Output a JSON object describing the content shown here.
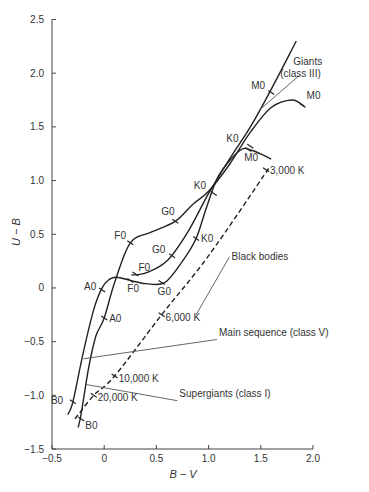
{
  "chart_data": {
    "type": "line",
    "title": "",
    "xlabel": "B − V",
    "ylabel": "U − B",
    "xlim": [
      -0.5,
      2.0
    ],
    "ylim": [
      -1.5,
      2.5
    ],
    "xticks": [
      "−0.5",
      "0",
      "0.5",
      "1.0",
      "1.5",
      "2.0"
    ],
    "xtick_values": [
      -0.5,
      0,
      0.5,
      1.0,
      1.5,
      2.0
    ],
    "yticks": [
      "2.5",
      "2.0",
      "1.5",
      "1.0",
      "0.5",
      "0",
      "−0.5",
      "−1.0",
      "−1.5"
    ],
    "ytick_values": [
      2.5,
      2.0,
      1.5,
      1.0,
      0.5,
      0,
      -0.5,
      -1.0,
      -1.5
    ],
    "grid": false,
    "series": [
      {
        "name": "Supergiants (class I)",
        "style": "solid",
        "x": [
          -0.25,
          -0.22,
          -0.15,
          -0.08,
          0.0,
          0.1,
          0.25,
          0.45,
          0.68,
          0.85,
          1.0,
          1.2,
          1.4,
          1.6,
          1.8,
          1.92
        ],
        "y": [
          -1.3,
          -1.17,
          -0.75,
          -0.45,
          -0.28,
          0.05,
          0.42,
          0.52,
          0.62,
          0.78,
          0.9,
          1.15,
          1.45,
          1.68,
          1.75,
          1.69
        ],
        "markers": [
          {
            "label": "B0",
            "x": -0.22,
            "y": -1.22
          },
          {
            "label": "A0",
            "x": 0.0,
            "y": -0.28
          },
          {
            "label": "F0",
            "x": 0.25,
            "y": 0.42
          },
          {
            "label": "G0",
            "x": 0.68,
            "y": 0.62
          },
          {
            "label": "K0",
            "x": 1.4,
            "y": 1.32
          },
          {
            "label": "M0",
            "x": 1.9,
            "y": 1.7
          }
        ]
      },
      {
        "name": "Main sequence (class V)",
        "style": "solid",
        "x": [
          -0.35,
          -0.3,
          -0.2,
          -0.1,
          -0.02,
          0.05,
          0.12,
          0.25,
          0.4,
          0.58,
          0.75,
          0.88,
          0.98,
          1.1,
          1.3,
          1.42,
          1.6
        ],
        "y": [
          -1.18,
          -1.06,
          -0.6,
          -0.2,
          0.0,
          0.08,
          0.1,
          0.07,
          0.04,
          0.05,
          0.25,
          0.46,
          0.75,
          1.05,
          1.28,
          1.28,
          1.2
        ],
        "markers": [
          {
            "label": "B0",
            "x": -0.3,
            "y": -1.06
          },
          {
            "label": "A0",
            "x": -0.02,
            "y": -0.02
          },
          {
            "label": "F0",
            "x": 0.25,
            "y": 0.07
          },
          {
            "label": "G0",
            "x": 0.55,
            "y": 0.05
          },
          {
            "label": "K0",
            "x": 0.88,
            "y": 0.46
          },
          {
            "label": "M0",
            "x": 1.38,
            "y": 1.29
          }
        ]
      },
      {
        "name": "Giants (class III)",
        "style": "solid",
        "x": [
          0.26,
          0.4,
          0.6,
          0.8,
          1.0,
          1.2,
          1.4,
          1.6,
          1.84
        ],
        "y": [
          0.12,
          0.14,
          0.25,
          0.52,
          0.88,
          1.2,
          1.5,
          1.85,
          2.3
        ],
        "markers": [
          {
            "label": "F0",
            "x": 0.3,
            "y": 0.13
          },
          {
            "label": "G0",
            "x": 0.65,
            "y": 0.3
          },
          {
            "label": "K0",
            "x": 1.05,
            "y": 0.88
          },
          {
            "label": "M0",
            "x": 1.6,
            "y": 1.82
          }
        ]
      },
      {
        "name": "Black bodies",
        "style": "dashed",
        "x": [
          -0.28,
          -0.1,
          0.1,
          0.55,
          1.0,
          1.58
        ],
        "y": [
          -1.22,
          -1.0,
          -0.82,
          -0.25,
          0.3,
          1.12
        ],
        "markers": [
          {
            "label": "20,000 K",
            "x": -0.1,
            "y": -1.0
          },
          {
            "label": "10,000 K",
            "x": 0.1,
            "y": -0.82
          },
          {
            "label": "6,000 K",
            "x": 0.55,
            "y": -0.25
          },
          {
            "label": "3,000 K",
            "x": 1.55,
            "y": 1.1
          }
        ]
      }
    ],
    "annotations": [
      {
        "text": "Giants",
        "x": 1.95,
        "y": 2.08
      },
      {
        "text": "(class III)",
        "x": 1.88,
        "y": 1.96
      },
      {
        "text": "Black bodies",
        "x": 1.22,
        "y": 0.26
      },
      {
        "text": "Main sequence (class V)",
        "x": 1.1,
        "y": -0.45
      },
      {
        "text": "Supergiants (class I)",
        "x": 0.72,
        "y": -1.02
      }
    ],
    "legend": null
  }
}
